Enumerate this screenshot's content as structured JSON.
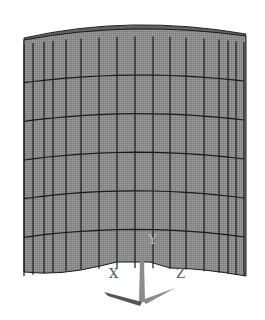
{
  "figure": {
    "type": "fe-mesh-render",
    "colors": {
      "background": "#ffffff",
      "face_fill": "#8a8a8a",
      "face_fill_light": "#9a9a9a",
      "top_fill": "#6a6a6a",
      "mesh_line": "#1a1a1a",
      "triad": "#8c8c8c"
    },
    "mesh": {
      "vertical_lines_x": [
        24,
        33,
        44,
        53,
        66,
        81,
        99,
        117,
        135,
        153,
        170,
        186,
        204,
        219,
        228,
        236,
        244
      ],
      "horizontal_rows": 6,
      "top_y_left": 38,
      "top_y_center": 30,
      "top_y_right": 36,
      "bottom_y_left": 272,
      "bottom_y_center": 262,
      "bottom_y_right": 272
    },
    "triad": {
      "x_label": "X",
      "y_label": "Y",
      "z_label": "Z"
    }
  }
}
